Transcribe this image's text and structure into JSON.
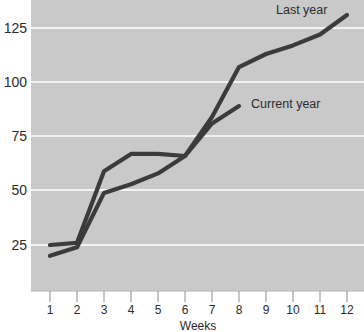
{
  "chart_data": {
    "type": "line",
    "title": "",
    "subtitle": "",
    "xlabel": "Weeks",
    "ylabel": "",
    "x": [
      1,
      2,
      3,
      4,
      5,
      6,
      7,
      8,
      9,
      10,
      11,
      12
    ],
    "categories": [
      "1",
      "2",
      "3",
      "4",
      "5",
      "6",
      "7",
      "8",
      "9",
      "10",
      "11",
      "12"
    ],
    "xtick_labels": [
      "1",
      "2",
      "3",
      "4",
      "5",
      "6",
      "7",
      "8",
      "9",
      "10",
      "11",
      "12"
    ],
    "ytick_labels": [
      "25",
      "50",
      "75",
      "100",
      "125"
    ],
    "yticks": [
      25,
      50,
      75,
      100,
      125
    ],
    "xlim": [
      0.6,
      12.4
    ],
    "ylim": [
      0,
      135
    ],
    "grid": "horizontal-only",
    "legend": "inline-annotations",
    "series": [
      {
        "name": "Last year",
        "label": "Last year",
        "color": "#3b3b3b",
        "values": [
          25,
          26,
          59,
          67,
          67,
          66,
          84,
          107,
          113,
          117,
          122,
          131
        ],
        "annotation": {
          "text": "Last year",
          "x": 10.3,
          "y": 133
        }
      },
      {
        "name": "Current year",
        "label": "Current year",
        "color": "#3b3b3b",
        "values": [
          20,
          24,
          49,
          53,
          58,
          66,
          81,
          89,
          null,
          null,
          null,
          null
        ],
        "annotation": {
          "text": "Current year",
          "x": 8.5,
          "y": 92
        }
      }
    ],
    "plot_background": "#c9c9c9",
    "gridline_color": "#f2f2f2",
    "line_color": "#3b3b3b",
    "text_color": "#2b2b2b"
  },
  "annotations": {
    "last_year_label": "Last year",
    "current_year_label": "Current year"
  },
  "axes": {
    "x_title": "Weeks"
  }
}
